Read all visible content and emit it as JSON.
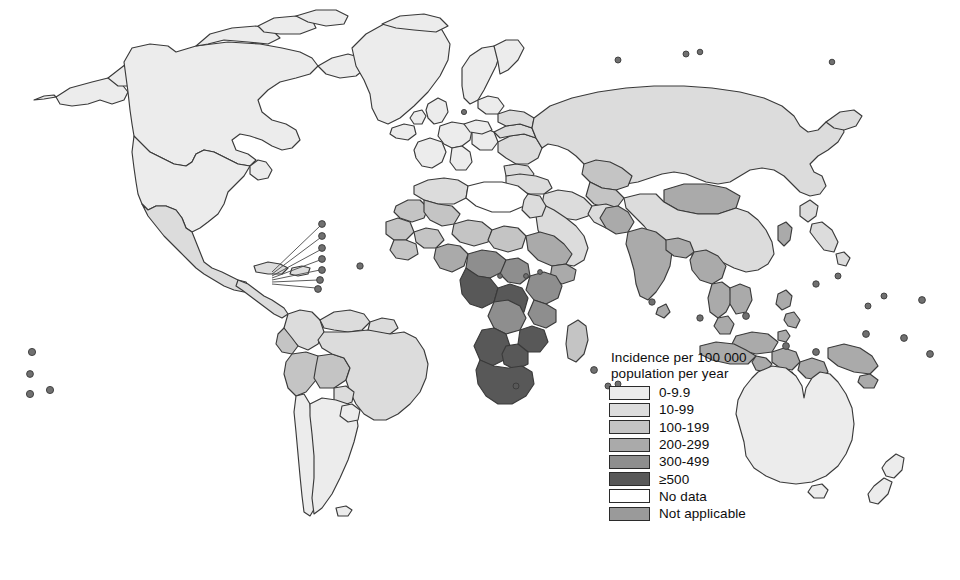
{
  "figure": {
    "type": "choropleth-world-map",
    "background": "#ffffff",
    "projection": "world-robinson-like"
  },
  "legend": {
    "title_line1": "Incidence per 100 000",
    "title_line2": "population per year",
    "items": [
      {
        "label": "0-9.9",
        "color": "#ececec",
        "border": "#2b2b2b"
      },
      {
        "label": "10-99",
        "color": "#dcdcdc",
        "border": "#2b2b2b"
      },
      {
        "label": "100-199",
        "color": "#c4c4c4",
        "border": "#2b2b2b"
      },
      {
        "label": "200-299",
        "color": "#aaaaaa",
        "border": "#2b2b2b"
      },
      {
        "label": "300-499",
        "color": "#8e8e8e",
        "border": "#2b2b2b"
      },
      {
        "label": "≥500",
        "color": "#585858",
        "border": "#2b2b2b"
      },
      {
        "label": "No data",
        "color": "#ffffff",
        "border": "#2b2b2b"
      },
      {
        "label": "Not applicable",
        "color": "#9a9a9a",
        "border": "#2b2b2b"
      }
    ]
  },
  "map": {
    "stroke": "#3a3a3a",
    "regions": [
      {
        "name": "greenland",
        "class": "0-9.9"
      },
      {
        "name": "canada",
        "class": "0-9.9"
      },
      {
        "name": "alaska",
        "class": "0-9.9"
      },
      {
        "name": "united-states",
        "class": "0-9.9"
      },
      {
        "name": "mexico",
        "class": "10-99"
      },
      {
        "name": "central-america",
        "class": "10-99"
      },
      {
        "name": "caribbean",
        "class": "10-99"
      },
      {
        "name": "colombia",
        "class": "10-99"
      },
      {
        "name": "venezuela",
        "class": "10-99"
      },
      {
        "name": "guianas",
        "class": "10-99"
      },
      {
        "name": "brazil",
        "class": "10-99"
      },
      {
        "name": "ecuador",
        "class": "100-199"
      },
      {
        "name": "peru",
        "class": "100-199"
      },
      {
        "name": "bolivia",
        "class": "100-199"
      },
      {
        "name": "chile",
        "class": "0-9.9"
      },
      {
        "name": "argentina",
        "class": "0-9.9"
      },
      {
        "name": "paraguay",
        "class": "10-99"
      },
      {
        "name": "uruguay",
        "class": "10-99"
      },
      {
        "name": "iceland",
        "class": "0-9.9"
      },
      {
        "name": "scandinavia",
        "class": "0-9.9"
      },
      {
        "name": "western-europe",
        "class": "0-9.9"
      },
      {
        "name": "eastern-europe",
        "class": "10-99"
      },
      {
        "name": "russia",
        "class": "10-99"
      },
      {
        "name": "kazakhstan",
        "class": "100-199"
      },
      {
        "name": "central-asia",
        "class": "100-199"
      },
      {
        "name": "turkey",
        "class": "10-99"
      },
      {
        "name": "middle-east",
        "class": "10-99"
      },
      {
        "name": "arabian-peninsula",
        "class": "10-99"
      },
      {
        "name": "north-africa",
        "class": "10-99"
      },
      {
        "name": "libya-egypt",
        "class": "No data"
      },
      {
        "name": "sahel",
        "class": "100-199"
      },
      {
        "name": "west-africa",
        "class": "100-199"
      },
      {
        "name": "nigeria",
        "class": "200-299"
      },
      {
        "name": "horn-of-africa",
        "class": "200-299"
      },
      {
        "name": "central-africa",
        "class": "300-499"
      },
      {
        "name": "east-africa",
        "class": "300-499"
      },
      {
        "name": "gabon-congo",
        "class": "≥500"
      },
      {
        "name": "zambia-zimbabwe",
        "class": "≥500"
      },
      {
        "name": "namibia-botswana",
        "class": "≥500"
      },
      {
        "name": "south-africa",
        "class": "≥500"
      },
      {
        "name": "madagascar",
        "class": "100-199"
      },
      {
        "name": "china",
        "class": "10-99"
      },
      {
        "name": "mongolia",
        "class": "200-299"
      },
      {
        "name": "korea",
        "class": "200-299"
      },
      {
        "name": "japan",
        "class": "10-99"
      },
      {
        "name": "india",
        "class": "200-299"
      },
      {
        "name": "pakistan",
        "class": "200-299"
      },
      {
        "name": "southeast-asia",
        "class": "200-299"
      },
      {
        "name": "indonesia",
        "class": "200-299"
      },
      {
        "name": "philippines",
        "class": "200-299"
      },
      {
        "name": "papua-new-guinea",
        "class": "200-299"
      },
      {
        "name": "australia",
        "class": "0-9.9"
      },
      {
        "name": "new-zealand",
        "class": "0-9.9"
      }
    ]
  }
}
